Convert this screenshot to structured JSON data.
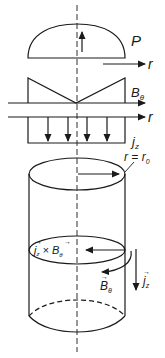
{
  "diagram": {
    "labels": {
      "pressure": "P",
      "r_axis_1": "r",
      "b_theta": "B",
      "b_theta_sub": "θ",
      "r_axis_2": "r",
      "j_z": "j",
      "j_z_sub": "z",
      "radius": "r = r",
      "radius_sub": "0",
      "force": "j",
      "force_sub": "z",
      "force_cross": " × B",
      "force_cross_sub": "θ",
      "b_vec": "B",
      "b_vec_sub": "θ",
      "j_vec": "j",
      "j_vec_sub": "z"
    },
    "panels": [
      {
        "name": "pressure-profile",
        "shape": "dome",
        "quantity": "P"
      },
      {
        "name": "b-theta-profile",
        "shape": "V (zero on axis, max at edge)",
        "quantity": "B_theta"
      },
      {
        "name": "jz-profile",
        "shape": "uniform",
        "quantity": "j_z",
        "arrow_count": 4
      },
      {
        "name": "cylinder",
        "annotations": [
          "r = r_0",
          "j_z × B_θ",
          "B_θ",
          "j_z"
        ]
      }
    ],
    "colors": {
      "ink": "#1a1a1a",
      "background": "#ffffff"
    }
  }
}
